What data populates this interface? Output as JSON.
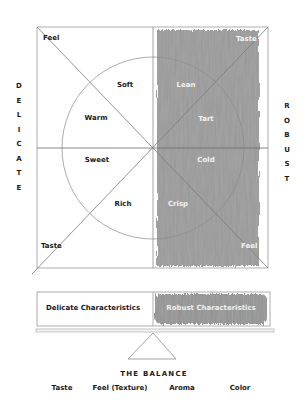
{
  "side_labels": {
    "left": [
      "D",
      "E",
      "L",
      "I",
      "C",
      "A",
      "T",
      "E"
    ],
    "right": [
      "R",
      "O",
      "B",
      "U",
      "S",
      "T"
    ]
  },
  "corners": {
    "top_left": "Feel",
    "top_right": "Taste",
    "bottom_left": "Taste",
    "bottom_right": "Feel"
  },
  "delicate_qualities": {
    "upper_right_of_left": "Soft",
    "upper_left": "Warm",
    "lower_left": "Sweet",
    "lower_right_of_left": "Rich"
  },
  "robust_qualities": {
    "upper_left": "Lean",
    "upper_right": "Tart",
    "lower_right": "Cold",
    "lower_left": "Crisp"
  },
  "scale": {
    "left_pan": "Delicate Characteristics",
    "right_pan": "Robust Characteristics",
    "title": "THE BALANCE"
  },
  "factors": [
    "Taste",
    "Feel (Texture)",
    "Aroma",
    "Color"
  ],
  "colors": {
    "line": "#8a8a8a",
    "shade": "#8c8c8c",
    "text": "#1a1a1a",
    "light_text": "#f2f2f2"
  }
}
